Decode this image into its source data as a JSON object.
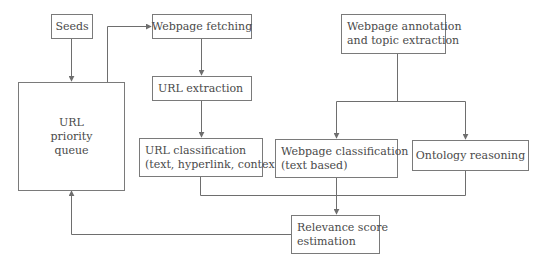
{
  "diagram": {
    "type": "flowchart",
    "nodes": {
      "seeds": {
        "lines": [
          "Seeds"
        ]
      },
      "queue": {
        "lines": [
          "URL",
          "priority",
          "queue"
        ]
      },
      "fetching": {
        "lines": [
          "Webpage fetching"
        ]
      },
      "extraction": {
        "lines": [
          "URL extraction"
        ]
      },
      "url_classification": {
        "lines": [
          "URL classification",
          "(text, hyperlink, context)"
        ]
      },
      "annotation": {
        "lines": [
          "Webpage annotation",
          "and topic extraction"
        ]
      },
      "webpage_classification": {
        "lines": [
          "Webpage classification",
          "(text based)"
        ]
      },
      "ontology": {
        "lines": [
          "Ontology reasoning"
        ]
      },
      "relevance": {
        "lines": [
          "Relevance score",
          "estimation"
        ]
      }
    },
    "edges": [
      {
        "from": "Seeds",
        "to": "URL priority queue"
      },
      {
        "from": "URL priority queue",
        "to": "Webpage fetching"
      },
      {
        "from": "Webpage fetching",
        "to": "URL extraction"
      },
      {
        "from": "URL extraction",
        "to": "URL classification"
      },
      {
        "from": "Webpage annotation and topic extraction",
        "to": "Webpage classification"
      },
      {
        "from": "Webpage annotation and topic extraction",
        "to": "Ontology reasoning"
      },
      {
        "from": "URL classification",
        "to": "Relevance score estimation"
      },
      {
        "from": "Webpage classification",
        "to": "Relevance score estimation"
      },
      {
        "from": "Ontology reasoning",
        "to": "Relevance score estimation"
      },
      {
        "from": "Relevance score estimation",
        "to": "URL priority queue"
      }
    ],
    "colors": {
      "line": "#6e6e6e",
      "box_border": "#7a7a7a",
      "text": "#4a4a4a",
      "background": "#ffffff"
    }
  }
}
